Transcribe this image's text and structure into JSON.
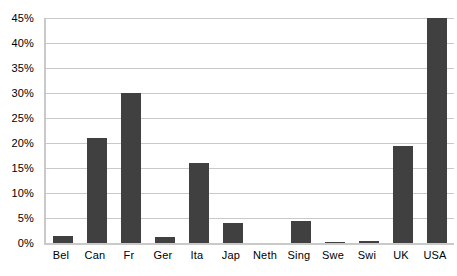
{
  "chart_data": {
    "type": "bar",
    "title": "",
    "subtitle": "",
    "xlabel": "",
    "ylabel": "",
    "categories": [
      "Bel",
      "Can",
      "Fr",
      "Ger",
      "Ita",
      "Jap",
      "Neth",
      "Sing",
      "Swe",
      "Swi",
      "UK",
      "USA"
    ],
    "values": [
      1.5,
      21,
      30,
      1.2,
      16,
      4,
      0,
      4.5,
      0.2,
      0.4,
      19.5,
      45
    ],
    "ylim": [
      0,
      45
    ],
    "ytick_step": 5,
    "ytick_labels": [
      "0%",
      "5%",
      "10%",
      "15%",
      "20%",
      "25%",
      "30%",
      "35%",
      "40%",
      "45%"
    ],
    "ytick_values": [
      0,
      5,
      10,
      15,
      20,
      25,
      30,
      35,
      40,
      45
    ],
    "grid": true,
    "grid_axis": "y",
    "legend": false,
    "legend_position": "none",
    "bar_color": "#404040",
    "grid_color": "#c9c9c9",
    "axis_color": "#c9c9c9",
    "background_color": "#ffffff",
    "text_color": "#000000"
  }
}
